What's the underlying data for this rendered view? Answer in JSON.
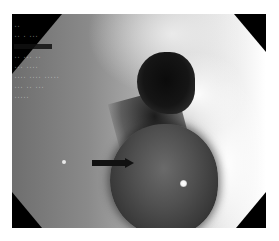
{
  "image": {
    "type": "endoscopic-view",
    "description": "Grayscale endoscopic image showing a dark lumen opening with a rounded smooth mass below it; a black arrow points at the mass.",
    "colors": {
      "background": "#ffffff",
      "mask": "#000000",
      "tissue_light": "#e9e9e9",
      "tissue_mid": "#8a8a8a",
      "lumen": "#0b0b0b",
      "arrow": "#111111"
    }
  },
  "overlay": {
    "lines": [
      "··",
      "·· · ···",
      "",
      "·· ··· ··",
      "··· ····",
      "···· ···· ·····",
      "··· ·· ···",
      "·····"
    ]
  },
  "annotation": {
    "arrow_direction": "right",
    "target": "mass"
  }
}
